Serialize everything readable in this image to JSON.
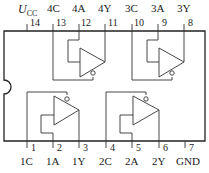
{
  "chip": {
    "description": "Quad bilateral switch / tri-state buffer pinout (14-pin DIP)",
    "supply_label": "U",
    "supply_subscript": "CC"
  },
  "top_pins": [
    {
      "number": "14",
      "label": "U_CC"
    },
    {
      "number": "13",
      "label": "4C"
    },
    {
      "number": "12",
      "label": "4A"
    },
    {
      "number": "11",
      "label": "4Y"
    },
    {
      "number": "10",
      "label": "3C"
    },
    {
      "number": "9",
      "label": "3A"
    },
    {
      "number": "8",
      "label": "3Y"
    }
  ],
  "bottom_pins": [
    {
      "number": "1",
      "label": "1C"
    },
    {
      "number": "2",
      "label": "1A"
    },
    {
      "number": "3",
      "label": "1Y"
    },
    {
      "number": "4",
      "label": "2C"
    },
    {
      "number": "5",
      "label": "2A"
    },
    {
      "number": "6",
      "label": "2Y"
    },
    {
      "number": "7",
      "label": "GND"
    }
  ],
  "gates": [
    {
      "name": "gate-4",
      "input": "4A",
      "control": "4C",
      "output": "4Y",
      "control_inverted": true
    },
    {
      "name": "gate-3",
      "input": "3A",
      "control": "3C",
      "output": "3Y",
      "control_inverted": true
    },
    {
      "name": "gate-1",
      "input": "1A",
      "control": "1C",
      "output": "1Y",
      "control_inverted": true
    },
    {
      "name": "gate-2",
      "input": "2A",
      "control": "2C",
      "output": "2Y",
      "control_inverted": true
    }
  ]
}
